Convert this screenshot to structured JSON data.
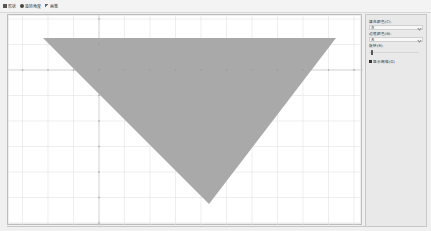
{
  "toolbar": {
    "items": [
      {
        "label": "形状",
        "icon": "shape-icon"
      },
      {
        "label": "旋转角度",
        "icon": "rotate-icon"
      },
      {
        "label": "画笔",
        "icon": "brush-icon"
      }
    ]
  },
  "canvas": {
    "background": "#ffffff",
    "grid_color": "#e2e2e2",
    "axis_color": "#c8c8c8",
    "shape": {
      "type": "triangle",
      "fill": "#a9a9a9",
      "orientation": "inverted"
    }
  },
  "panel": {
    "fill_color_label": "填充颜色(C):",
    "fill_color_value": "灰",
    "line_color_label": "边框颜色(B):",
    "line_color_value": "无",
    "rotation_label": "旋转(R):",
    "rotation_value": 0,
    "show_grid_label": "显示网格(G)",
    "show_grid_checked": true
  }
}
